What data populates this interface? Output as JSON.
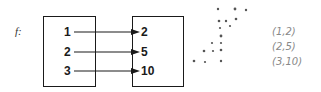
{
  "function_label": "f:",
  "domain": [
    "1",
    "2",
    "3"
  ],
  "range": [
    "2",
    "5",
    "10"
  ],
  "mapping": [
    {
      "from": "1",
      "to": "2"
    },
    {
      "from": "2",
      "to": "5"
    },
    {
      "from": "3",
      "to": "10"
    }
  ],
  "ordered_pairs": [
    "(1,2)",
    "(2,5)",
    "(3,10)"
  ],
  "colors": {
    "ink": "#1a1a1a",
    "scatter": "#555555",
    "handwriting": "#888888"
  }
}
